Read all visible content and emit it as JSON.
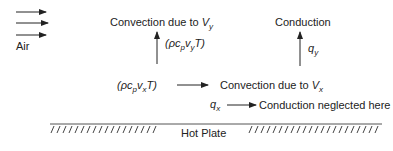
{
  "diagram": {
    "air_label": "Air",
    "top_left_label": "Convection due to ",
    "top_left_var": "V",
    "top_left_sub": "y",
    "top_right_label": "Conduction",
    "vertical_flux": {
      "open": "(ρc",
      "sub1": "p",
      "v": "v",
      "sub2": "y",
      "close": "T)"
    },
    "qy": {
      "q": "q",
      "sub": "y"
    },
    "horizontal_flux": {
      "open": "(ρc",
      "sub1": "p",
      "v": "v",
      "sub2": "x",
      "close": "T)"
    },
    "mid_label": "Convection due to ",
    "mid_var": "V",
    "mid_sub": "x",
    "qx": {
      "q": "q",
      "sub": "x"
    },
    "bottom_label": "Conduction neglected here",
    "plate_label": "Hot Plate"
  }
}
